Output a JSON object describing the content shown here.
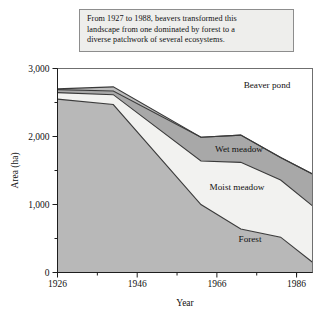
{
  "caption": {
    "lines": [
      "From 1927 to 1988, beavers transformed this",
      "landscape from one dominated by forest to a",
      "diverse patchwork of several ecosystems."
    ]
  },
  "chart_data": {
    "type": "area",
    "stacked": true,
    "title": "",
    "xlabel": "Year",
    "ylabel": "Area (ha)",
    "xlim": [
      1926,
      1990
    ],
    "ylim": [
      0,
      3000
    ],
    "xticks": [
      1926,
      1946,
      1966,
      1986
    ],
    "xtick_labels": [
      "1926",
      "1946",
      "1966",
      "1986"
    ],
    "xminor_ticks": [
      1936,
      1956,
      1976,
      1986
    ],
    "yticks": [
      0,
      1000,
      2000,
      3000
    ],
    "ytick_labels": [
      "0",
      "1,000",
      "2,000",
      "3,000"
    ],
    "yminor_ticks": [
      500,
      1500,
      2500
    ],
    "grid": false,
    "legend_position": "inline-labels",
    "x": [
      1926,
      1940,
      1962,
      1972,
      1982,
      1990
    ],
    "series": [
      {
        "name": "Forest",
        "order": 1,
        "color": "#b8b8b8",
        "values": [
          2550,
          2470,
          1000,
          640,
          520,
          150
        ]
      },
      {
        "name": "Moist meadow",
        "order": 2,
        "color": "#f2f2f0",
        "values": [
          95,
          145,
          640,
          980,
          840,
          830
        ]
      },
      {
        "name": "Wet meadow",
        "order": 3,
        "color": "#a8a8a8",
        "values": [
          45,
          55,
          350,
          400,
          330,
          470
        ]
      },
      {
        "name": "Beaver pond",
        "order": 4,
        "color": "#bcbcbc",
        "values": [
          10,
          60,
          0,
          0,
          0,
          0
        ]
      }
    ],
    "cumulative_totals": {
      "forest_top": [
        2550,
        2470,
        1000,
        640,
        520,
        150
      ],
      "moist_meadow_top": [
        2645,
        2615,
        1640,
        1620,
        1360,
        980
      ],
      "wet_meadow_top": [
        2690,
        2670,
        1990,
        2020,
        1690,
        1450
      ],
      "beaver_pond_top": [
        2700,
        2730,
        1990,
        2020,
        1690,
        1450
      ]
    },
    "band_labels": [
      {
        "name": "Beaver pond",
        "x": 267,
        "y": 88
      },
      {
        "name": "Wet meadow",
        "x": 239,
        "y": 152
      },
      {
        "name": "Moist meadow",
        "x": 237,
        "y": 190
      },
      {
        "name": "Forest",
        "x": 250,
        "y": 242
      }
    ]
  },
  "colors": {
    "background": "#ffffff",
    "panel": "#bcbcbc",
    "caption_bg": "#eeeeec",
    "caption_border": "#8d8d8d",
    "axis": "#1d1d1d",
    "edge": "#3a3a3a"
  }
}
